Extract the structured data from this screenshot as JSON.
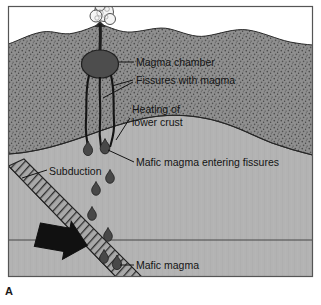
{
  "figure": {
    "panel_label": "A",
    "caption_labels": {
      "magma_chamber": "Magma chamber",
      "fissures_with_magma": "Fissures with magma",
      "heating_line1": "Heating of",
      "heating_line2": "lower crust",
      "mafic_entering": "Mafic magma entering fissures",
      "subduction": "Subduction",
      "mafic_magma": "Mafic magma"
    }
  },
  "colors": {
    "sky": "#ffffff",
    "upper_crust": "#8f8f8f",
    "upper_crust_stipple": "#4a4a4a",
    "lower_crust": "#b3b3b3",
    "magma_body": "#4a4a4a",
    "slab_fill": "#a8a8a8",
    "slab_hatch": "#303030",
    "arrow": "#111111",
    "outline": "#1a1a1a",
    "text": "#141414",
    "plume": "#f2f2f2"
  },
  "geometry": {
    "frame": {
      "x": 8,
      "y": 6,
      "width": 305,
      "height": 271
    },
    "volcano_vent_x": 100,
    "magma_chamber": {
      "cx": 100,
      "cy": 64,
      "rx": 18,
      "ry": 14
    },
    "crust_boundary_note": "upper stippled crust over lighter lower crust",
    "horizontal_reference_line_y": 240,
    "droplet_count": 9,
    "fissure_count": 3
  },
  "droplets": [
    {
      "x": 88,
      "y": 150,
      "s": 1.0
    },
    {
      "x": 105,
      "y": 148,
      "s": 1.05
    },
    {
      "x": 110,
      "y": 178,
      "s": 0.95
    },
    {
      "x": 96,
      "y": 190,
      "s": 0.95
    },
    {
      "x": 92,
      "y": 215,
      "s": 0.95
    },
    {
      "x": 108,
      "y": 236,
      "s": 0.95
    },
    {
      "x": 104,
      "y": 258,
      "s": 0.95
    },
    {
      "x": 115,
      "y": 262,
      "s": 0.9
    },
    {
      "x": 114,
      "y": 270,
      "s": 1.0
    }
  ]
}
